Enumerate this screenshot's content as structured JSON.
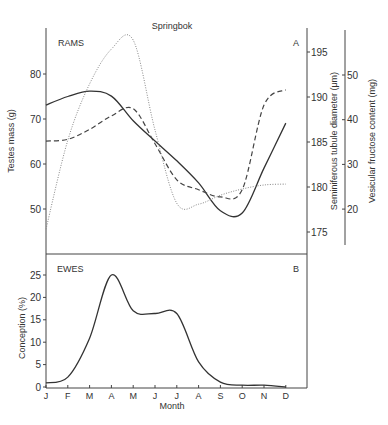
{
  "figure": {
    "title": "Springbok",
    "panel_a_label": "RAMS",
    "panel_a_letter": "A",
    "panel_b_label": "EWES",
    "panel_b_letter": "B",
    "xlabel": "Month"
  },
  "chart_data": [
    {
      "type": "line",
      "panel": "A",
      "title": "Springbok",
      "subtitle": "RAMS",
      "xlabel": "",
      "categories": [
        "J",
        "F",
        "M",
        "A",
        "M",
        "J",
        "J",
        "A",
        "S",
        "O",
        "N",
        "D"
      ],
      "axes": [
        {
          "id": "left",
          "label": "Testes mass (g)",
          "ticks": [
            50,
            60,
            70,
            80
          ],
          "ylim": [
            44,
            85
          ]
        },
        {
          "id": "right1",
          "label": "Seminiferous tubule diameter (μm)",
          "ticks": [
            175,
            180,
            185,
            190,
            195
          ],
          "ylim": [
            172,
            197
          ]
        },
        {
          "id": "right2",
          "label": "Vesicular fructose content (mg)",
          "ticks": [
            20,
            30,
            40,
            50
          ],
          "ylim": [
            12,
            60
          ]
        }
      ],
      "series": [
        {
          "name": "Testes mass",
          "axis": "left",
          "style": "solid",
          "values": [
            73.1,
            75.0,
            76.2,
            75.1,
            69.6,
            65.1,
            60.7,
            55.8,
            49.6,
            49.1,
            59.1,
            69.1
          ]
        },
        {
          "name": "Seminiferous tubule diameter",
          "axis": "right1",
          "style": "dashed",
          "values": [
            185.1,
            185.3,
            186.4,
            187.9,
            188.7,
            184.8,
            180.8,
            179.7,
            178.9,
            179.7,
            189.1,
            190.8
          ]
        },
        {
          "name": "Vesicular fructose content",
          "axis": "right2",
          "style": "dotted",
          "values": [
            15.5,
            35.4,
            48.0,
            55.8,
            57.8,
            37.7,
            21.3,
            21.1,
            23.1,
            24.5,
            25.4,
            25.6
          ]
        }
      ],
      "grid": false,
      "legend": "none"
    },
    {
      "type": "line",
      "panel": "B",
      "subtitle": "EWES",
      "xlabel": "Month",
      "ylabel": "Conception (%)",
      "categories": [
        "J",
        "F",
        "M",
        "A",
        "M",
        "J",
        "J",
        "A",
        "S",
        "O",
        "N",
        "D"
      ],
      "ticks": [
        0,
        5,
        10,
        15,
        20,
        25
      ],
      "ylim": [
        0,
        29
      ],
      "series": [
        {
          "name": "Conception",
          "style": "solid",
          "values": [
            0.9,
            2.2,
            10.9,
            25.0,
            17.0,
            16.4,
            16.4,
            5.6,
            1.1,
            0.4,
            0.4,
            0.0
          ]
        }
      ],
      "grid": false,
      "legend": "none"
    }
  ]
}
